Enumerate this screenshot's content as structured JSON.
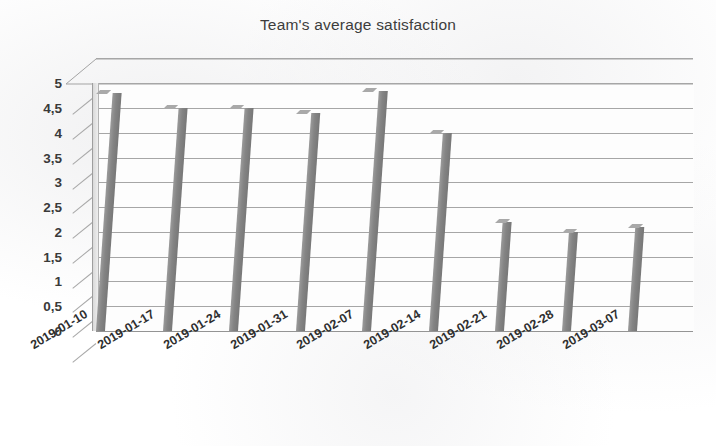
{
  "chart_data": {
    "type": "bar",
    "title": "Team's average satisfaction",
    "xlabel": "",
    "ylabel": "",
    "ylim": [
      0,
      5
    ],
    "grid": true,
    "legend": "none",
    "style": "3d-bar-scanned",
    "bar_color": "#848484",
    "categories": [
      "2019-01-10",
      "2019-01-17",
      "2019-01-24",
      "2019-01-31",
      "2019-02-07",
      "2019-02-14",
      "2019-02-21",
      "2019-02-28",
      "2019-03-07"
    ],
    "values": [
      4.8,
      4.5,
      4.5,
      4.4,
      4.85,
      4.0,
      2.2,
      2.0,
      2.1
    ],
    "ytick_labels": [
      "0",
      "0,5",
      "1",
      "1,5",
      "2",
      "2,5",
      "3",
      "3,5",
      "4",
      "4,5",
      "5"
    ],
    "ytick_values": [
      0,
      0.5,
      1,
      1.5,
      2,
      2.5,
      3,
      3.5,
      4,
      4.5,
      5
    ]
  }
}
